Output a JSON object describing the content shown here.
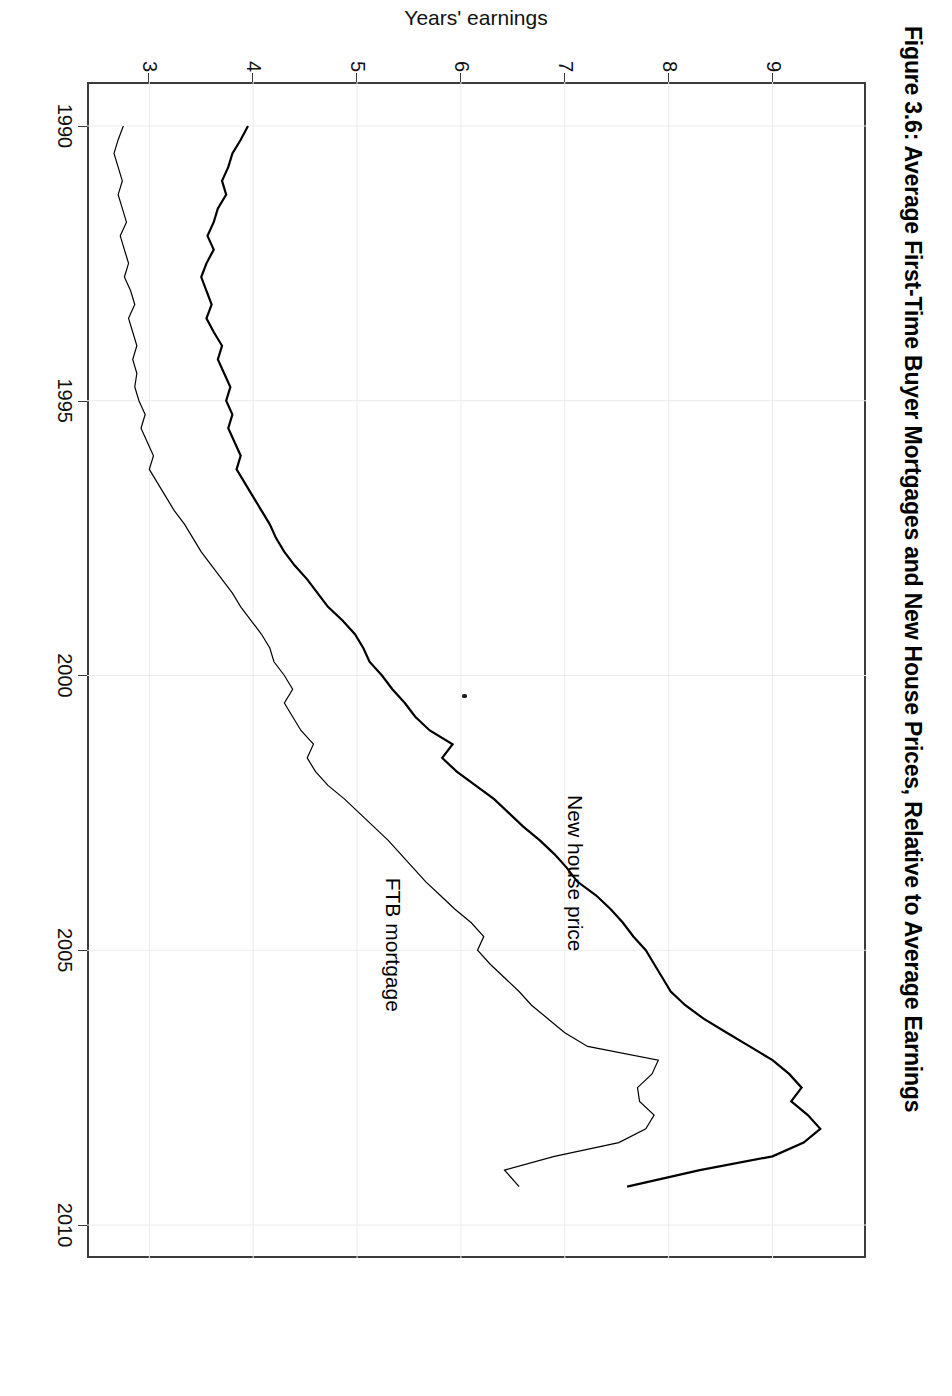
{
  "figure": {
    "title": "Figure 3.6: Average First-Time Buyer Mortgages and New House Prices, Relative to Average Earnings",
    "orientation": "rotated-90-clockwise"
  },
  "chart_data": {
    "type": "line",
    "title": "Figure 3.6: Average First-Time Buyer Mortgages and New House Prices, Relative to Average Earnings",
    "xlabel": "",
    "ylabel": "Years' earnings",
    "xlim": [
      1989.2,
      2010.6
    ],
    "ylim": [
      2.4,
      9.9
    ],
    "xticks": [
      1990,
      1995,
      2000,
      2005,
      2010
    ],
    "xtick_labels": [
      "1990",
      "1995",
      "2000",
      "2005",
      "2010"
    ],
    "yticks": [
      3,
      4,
      5,
      6,
      7,
      8,
      9
    ],
    "ytick_labels": [
      "3",
      "4",
      "5",
      "6",
      "7",
      "8",
      "9"
    ],
    "grid": true,
    "legend": "inline-annotations",
    "x": [
      1990.0,
      1990.25,
      1990.5,
      1990.75,
      1991.0,
      1991.25,
      1991.5,
      1991.75,
      1992.0,
      1992.25,
      1992.5,
      1992.75,
      1993.0,
      1993.25,
      1993.5,
      1993.75,
      1994.0,
      1994.25,
      1994.5,
      1994.75,
      1995.0,
      1995.25,
      1995.5,
      1995.75,
      1996.0,
      1996.25,
      1996.5,
      1996.75,
      1997.0,
      1997.25,
      1997.5,
      1997.75,
      1998.0,
      1998.25,
      1998.5,
      1998.75,
      1999.0,
      1999.25,
      1999.5,
      1999.75,
      2000.0,
      2000.25,
      2000.5,
      2000.75,
      2001.0,
      2001.25,
      2001.5,
      2001.75,
      2002.0,
      2002.25,
      2002.5,
      2002.75,
      2003.0,
      2003.25,
      2003.5,
      2003.75,
      2004.0,
      2004.25,
      2004.5,
      2004.75,
      2005.0,
      2005.25,
      2005.5,
      2005.75,
      2006.0,
      2006.25,
      2006.5,
      2006.75,
      2007.0,
      2007.25,
      2007.5,
      2007.75,
      2008.0,
      2008.25,
      2008.5,
      2008.75,
      2009.0,
      2009.3
    ],
    "series": [
      {
        "name": "New house price",
        "label": "New house price",
        "color": "#000000",
        "linewidth": 2.2,
        "values": [
          3.95,
          3.88,
          3.8,
          3.76,
          3.7,
          3.74,
          3.66,
          3.62,
          3.56,
          3.62,
          3.55,
          3.5,
          3.55,
          3.6,
          3.55,
          3.62,
          3.7,
          3.66,
          3.72,
          3.78,
          3.74,
          3.8,
          3.76,
          3.82,
          3.88,
          3.84,
          3.92,
          4.0,
          4.08,
          4.16,
          4.22,
          4.3,
          4.4,
          4.52,
          4.62,
          4.72,
          4.86,
          4.98,
          5.06,
          5.12,
          5.24,
          5.34,
          5.46,
          5.56,
          5.7,
          5.92,
          5.82,
          5.96,
          6.14,
          6.32,
          6.46,
          6.6,
          6.76,
          6.9,
          7.02,
          7.12,
          7.3,
          7.44,
          7.56,
          7.66,
          7.78,
          7.86,
          7.94,
          8.02,
          8.16,
          8.34,
          8.56,
          8.78,
          9.0,
          9.16,
          9.28,
          9.18,
          9.34,
          9.46,
          9.3,
          9.0,
          8.3,
          7.6
        ]
      },
      {
        "name": "FTB mortgage",
        "label": "FTB mortgage",
        "color": "#000000",
        "linewidth": 1.2,
        "values": [
          2.75,
          2.7,
          2.66,
          2.7,
          2.74,
          2.7,
          2.74,
          2.78,
          2.72,
          2.76,
          2.8,
          2.76,
          2.82,
          2.86,
          2.8,
          2.84,
          2.88,
          2.84,
          2.88,
          2.86,
          2.9,
          2.96,
          2.92,
          2.98,
          3.04,
          3.0,
          3.08,
          3.16,
          3.24,
          3.34,
          3.42,
          3.5,
          3.6,
          3.7,
          3.8,
          3.88,
          3.98,
          4.08,
          4.16,
          4.2,
          4.3,
          4.38,
          4.3,
          4.38,
          4.46,
          4.58,
          4.52,
          4.6,
          4.72,
          4.88,
          5.02,
          5.16,
          5.3,
          5.42,
          5.54,
          5.66,
          5.8,
          5.94,
          6.1,
          6.22,
          6.16,
          6.28,
          6.42,
          6.56,
          6.68,
          6.84,
          7.0,
          7.22,
          7.9,
          7.84,
          7.7,
          7.72,
          7.86,
          7.78,
          7.52,
          6.9,
          6.42,
          6.56
        ]
      }
    ],
    "annotations": [
      {
        "text": "New house price",
        "x": 2003.6,
        "y": 7.1
      },
      {
        "text": "FTB mortgage",
        "x": 2004.9,
        "y": 5.35
      }
    ]
  }
}
